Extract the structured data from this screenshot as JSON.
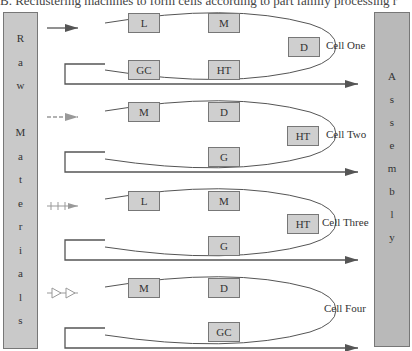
{
  "caption": "B. Reclustering machines to form cells according to part family processing r",
  "raw_materials": {
    "label": "Raw Materials",
    "letters": [
      "R",
      "a",
      "w",
      "",
      "M",
      "a",
      "t",
      "e",
      "r",
      "i",
      "a",
      "l",
      "s"
    ]
  },
  "assembly": {
    "label": "Assembly",
    "letters": [
      "A",
      "s",
      "s",
      "e",
      "m",
      "b",
      "l",
      "y"
    ]
  },
  "colors": {
    "machine_fill": "#cfcfcf",
    "bar_fill": "#c9c9c9",
    "line": "#555555"
  },
  "cells": [
    {
      "name": "Cell One",
      "input_arrow_style": "solid",
      "machines": [
        {
          "label": "L",
          "x": 128,
          "y": 13
        },
        {
          "label": "M",
          "x": 208,
          "y": 13
        },
        {
          "label": "D",
          "x": 288,
          "y": 37
        },
        {
          "label": "GC",
          "x": 128,
          "y": 60
        },
        {
          "label": "HT",
          "x": 208,
          "y": 60
        }
      ]
    },
    {
      "name": "Cell Two",
      "input_arrow_style": "dashed",
      "machines": [
        {
          "label": "M",
          "x": 128,
          "y": 102
        },
        {
          "label": "D",
          "x": 208,
          "y": 102
        },
        {
          "label": "HT",
          "x": 287,
          "y": 126
        },
        {
          "label": "G",
          "x": 208,
          "y": 147
        }
      ]
    },
    {
      "name": "Cell Three",
      "input_arrow_style": "plus",
      "machines": [
        {
          "label": "L",
          "x": 128,
          "y": 191
        },
        {
          "label": "M",
          "x": 208,
          "y": 191
        },
        {
          "label": "HT",
          "x": 287,
          "y": 214
        },
        {
          "label": "G",
          "x": 208,
          "y": 236
        }
      ]
    },
    {
      "name": "Cell Four",
      "input_arrow_style": "open-triangles",
      "machines": [
        {
          "label": "M",
          "x": 128,
          "y": 278
        },
        {
          "label": "D",
          "x": 208,
          "y": 278
        },
        {
          "label": "GC",
          "x": 208,
          "y": 322
        }
      ]
    }
  ]
}
